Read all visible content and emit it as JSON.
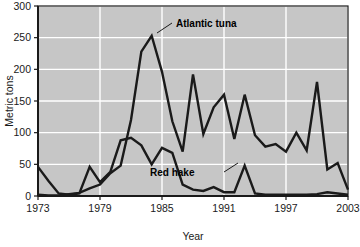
{
  "chart_data": {
    "type": "line",
    "title": "",
    "xlabel": "Year",
    "ylabel": "Metric tons",
    "xlim": [
      1973,
      2003
    ],
    "ylim": [
      0,
      300
    ],
    "ytick_labels": [
      "0",
      "50",
      "100",
      "150",
      "200",
      "250",
      "300"
    ],
    "yticks": [
      0,
      50,
      100,
      150,
      200,
      250,
      300
    ],
    "xtick_labels": [
      "1973",
      "1979",
      "1985",
      "1991",
      "1997",
      "2003"
    ],
    "xticks": [
      1973,
      1979,
      1985,
      1991,
      1997,
      2003
    ],
    "grid": true,
    "grid_color": "#ffffff",
    "plot_background": "#c6c6c6",
    "line_color": "#1a1a1a",
    "legend": "annotations",
    "x": [
      1973,
      1974,
      1975,
      1976,
      1977,
      1978,
      1979,
      1980,
      1981,
      1982,
      1983,
      1984,
      1985,
      1986,
      1987,
      1988,
      1989,
      1990,
      1991,
      1992,
      1993,
      1994,
      1995,
      1996,
      1997,
      1998,
      1999,
      2000,
      2001,
      2002,
      2003
    ],
    "series": [
      {
        "name": "Atlantic tuna",
        "values": [
          2,
          1,
          1,
          3,
          5,
          12,
          18,
          36,
          48,
          120,
          228,
          253,
          196,
          118,
          70,
          192,
          98,
          140,
          160,
          90,
          160,
          96,
          78,
          82,
          70,
          100,
          72,
          180,
          42,
          52,
          10
        ]
      },
      {
        "name": "Red hake",
        "values": [
          46,
          24,
          4,
          2,
          4,
          46,
          22,
          38,
          88,
          92,
          80,
          50,
          76,
          68,
          18,
          10,
          8,
          14,
          6,
          6,
          48,
          4,
          2,
          2,
          2,
          2,
          2,
          3,
          6,
          4,
          2
        ]
      }
    ],
    "annotations": [
      {
        "label": "Atlantic tuna",
        "x": 1985.5,
        "y": 268
      },
      {
        "label": "Red hake",
        "x": 1986.2,
        "y": 30
      }
    ]
  },
  "axes": {
    "y_title": "Metric tons",
    "x_title": "Year"
  }
}
